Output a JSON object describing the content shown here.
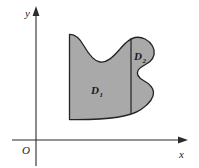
{
  "figure": {
    "type": "math-diagram",
    "background_color": "#ffffff",
    "axes": {
      "color": "#2b2b2b",
      "origin_label": "O",
      "x_axis": {
        "label": "x",
        "arrow": "right-arrow-icon"
      },
      "y_axis": {
        "label": "y",
        "arrow": "up-arrow-icon"
      }
    },
    "region": {
      "fill_color": "#a9a9a9",
      "stroke_color": "#232323",
      "labels": [
        {
          "name": "D1",
          "base": "D",
          "subscript": "1"
        },
        {
          "name": "D2",
          "base": "D",
          "subscript": "2"
        }
      ],
      "divider": {
        "name": "vertical-divider",
        "color": "#232323"
      }
    }
  }
}
